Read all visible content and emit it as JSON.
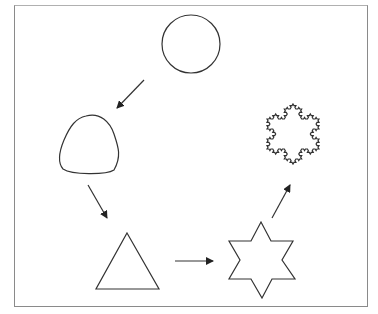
{
  "diagram": {
    "colors": {
      "stroke": "#333333",
      "frame": "#8a8a8a",
      "background": "#ffffff"
    },
    "nodes": [
      {
        "id": "circle",
        "label": "Circle"
      },
      {
        "id": "rounded-triangle",
        "label": "Rounded triangle"
      },
      {
        "id": "triangle",
        "label": "Triangle"
      },
      {
        "id": "star",
        "label": "Six-pointed star"
      },
      {
        "id": "snowflake",
        "label": "Koch snowflake"
      }
    ],
    "edges": [
      {
        "from": "circle",
        "to": "rounded-triangle"
      },
      {
        "from": "rounded-triangle",
        "to": "triangle"
      },
      {
        "from": "triangle",
        "to": "star"
      },
      {
        "from": "star",
        "to": "snowflake"
      }
    ]
  }
}
